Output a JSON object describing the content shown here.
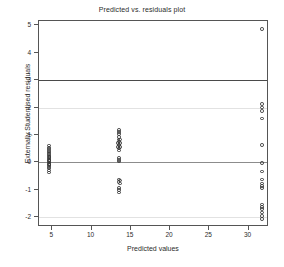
{
  "chart_data": {
    "type": "scatter",
    "title": "Predicted vs. residuals plot",
    "xlabel": "Predicted values",
    "ylabel": "Externally Studentised residuals",
    "xlim": [
      3.3,
      32.6
    ],
    "ylim": [
      -2.35,
      5.15
    ],
    "xticks": [
      5,
      10,
      15,
      20,
      25,
      30
    ],
    "xtick_labels": [
      "5",
      "10",
      "15",
      "20",
      "25",
      "30"
    ],
    "yticks": [
      5,
      4,
      3,
      2,
      1,
      0,
      -1,
      -2
    ],
    "ytick_labels": [
      "5",
      "4",
      "3",
      "2",
      "1",
      "0",
      "-1",
      "-2"
    ],
    "grid": false,
    "legend": false,
    "marker": "open-circle",
    "marker_color": "#3a3a3a",
    "reference_lines": [
      {
        "y": 3,
        "style": "solid",
        "color": "#4a4a4a",
        "weight": "dark"
      },
      {
        "y": 2,
        "style": "solid",
        "color": "#e2e2e2",
        "weight": "faint"
      },
      {
        "y": 0,
        "style": "solid",
        "color": "#8c8c8c",
        "weight": "mid"
      },
      {
        "y": -2,
        "style": "solid",
        "color": "#e2e2e2",
        "weight": "faint"
      }
    ],
    "clusters": [
      {
        "name": "cluster-low-predicted",
        "x": 4.6,
        "n": 22
      },
      {
        "name": "cluster-mid-predicted",
        "x": 13.5,
        "n": 23
      },
      {
        "name": "cluster-high-predicted",
        "x": 31.7,
        "n": 18
      }
    ],
    "points": [
      {
        "x": 4.6,
        "y": 0.62
      },
      {
        "x": 4.6,
        "y": 0.55
      },
      {
        "x": 4.6,
        "y": 0.48
      },
      {
        "x": 4.6,
        "y": 0.42
      },
      {
        "x": 4.6,
        "y": 0.36
      },
      {
        "x": 4.6,
        "y": 0.3
      },
      {
        "x": 4.6,
        "y": 0.25
      },
      {
        "x": 4.55,
        "y": 0.2
      },
      {
        "x": 4.65,
        "y": 0.2
      },
      {
        "x": 4.6,
        "y": 0.15
      },
      {
        "x": 4.55,
        "y": 0.1
      },
      {
        "x": 4.65,
        "y": 0.1
      },
      {
        "x": 4.6,
        "y": 0.05
      },
      {
        "x": 4.55,
        "y": 0.0
      },
      {
        "x": 4.65,
        "y": 0.0
      },
      {
        "x": 4.6,
        "y": -0.05
      },
      {
        "x": 4.55,
        "y": -0.1
      },
      {
        "x": 4.65,
        "y": -0.1
      },
      {
        "x": 4.6,
        "y": -0.16
      },
      {
        "x": 4.6,
        "y": -0.22
      },
      {
        "x": 4.6,
        "y": -0.29
      },
      {
        "x": 4.6,
        "y": -0.37
      },
      {
        "x": 13.5,
        "y": 1.18
      },
      {
        "x": 13.5,
        "y": 1.11
      },
      {
        "x": 13.5,
        "y": 1.03
      },
      {
        "x": 13.5,
        "y": 0.93
      },
      {
        "x": 13.45,
        "y": 0.84
      },
      {
        "x": 13.6,
        "y": 0.84
      },
      {
        "x": 13.5,
        "y": 0.76
      },
      {
        "x": 13.4,
        "y": 0.7
      },
      {
        "x": 13.62,
        "y": 0.7
      },
      {
        "x": 13.5,
        "y": 0.63
      },
      {
        "x": 13.4,
        "y": 0.57
      },
      {
        "x": 13.62,
        "y": 0.57
      },
      {
        "x": 13.5,
        "y": 0.51
      },
      {
        "x": 13.5,
        "y": 0.44
      },
      {
        "x": 13.5,
        "y": 0.17
      },
      {
        "x": 13.5,
        "y": 0.1
      },
      {
        "x": 13.5,
        "y": 0.03
      },
      {
        "x": 13.5,
        "y": -0.62
      },
      {
        "x": 13.6,
        "y": -0.66
      },
      {
        "x": 13.45,
        "y": -0.72
      },
      {
        "x": 13.6,
        "y": -0.76
      },
      {
        "x": 13.5,
        "y": -0.93
      },
      {
        "x": 13.5,
        "y": -1.0
      },
      {
        "x": 13.5,
        "y": -1.09
      },
      {
        "x": 31.7,
        "y": 4.85
      },
      {
        "x": 31.7,
        "y": 2.13
      },
      {
        "x": 31.7,
        "y": 2.0
      },
      {
        "x": 31.7,
        "y": 1.88
      },
      {
        "x": 31.7,
        "y": 1.6
      },
      {
        "x": 31.7,
        "y": 0.63
      },
      {
        "x": 31.7,
        "y": -0.02
      },
      {
        "x": 31.7,
        "y": -0.33
      },
      {
        "x": 31.7,
        "y": -0.62
      },
      {
        "x": 31.7,
        "y": -0.76
      },
      {
        "x": 31.7,
        "y": -0.86
      },
      {
        "x": 31.7,
        "y": -0.93
      },
      {
        "x": 31.7,
        "y": -1.53
      },
      {
        "x": 31.7,
        "y": -1.62
      },
      {
        "x": 31.7,
        "y": -1.7
      },
      {
        "x": 31.7,
        "y": -1.82
      },
      {
        "x": 31.7,
        "y": -1.94
      },
      {
        "x": 31.7,
        "y": -2.05
      }
    ]
  }
}
